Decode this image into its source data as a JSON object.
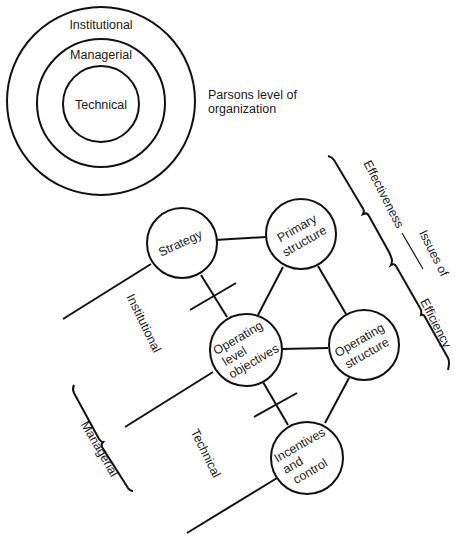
{
  "parsons": {
    "rings": [
      {
        "label": "Institutional"
      },
      {
        "label": "Managerial"
      },
      {
        "label": "Technical"
      }
    ],
    "caption_line1": "Parsons level of",
    "caption_line2": "organization"
  },
  "nodes": {
    "strategy": {
      "lines": [
        "Strategy"
      ]
    },
    "primary": {
      "lines": [
        "Primary",
        "structure"
      ]
    },
    "olo": {
      "lines": [
        "Operating",
        "level",
        "objectives"
      ]
    },
    "opstruct": {
      "lines": [
        "Operating",
        "structure"
      ]
    },
    "incentives": {
      "lines": [
        "Incentives",
        "and",
        "control"
      ]
    }
  },
  "levels": {
    "institutional": "Institutional",
    "managerial": "Managerial",
    "technical": "Technical"
  },
  "issues": {
    "effectiveness": "Effectiveness",
    "issues_of": "Issues of",
    "efficiency": "Efficiency"
  }
}
